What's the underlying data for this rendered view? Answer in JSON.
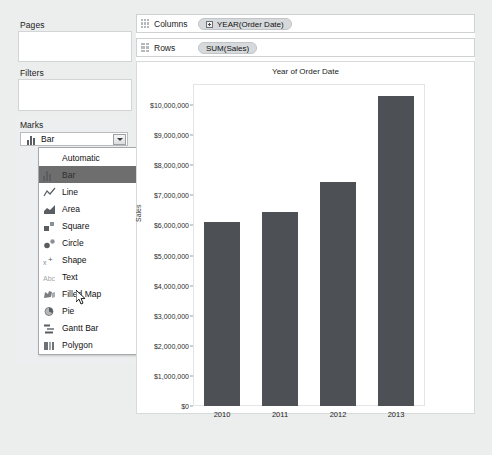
{
  "app": {
    "shelves": {
      "pages_label": "Pages",
      "filters_label": "Filters",
      "marks_label": "Marks"
    },
    "columns_shelf": {
      "name": "Columns",
      "pill": "YEAR(Order Date)",
      "pill_icon": "plus-expand-icon"
    },
    "rows_shelf": {
      "name": "Rows",
      "pill": "SUM(Sales)"
    }
  },
  "marks": {
    "selected": "Bar",
    "selected_icon": "bar-mark-icon",
    "dropdown_open": true,
    "highlighted_index": 1,
    "options": [
      {
        "label": "Automatic",
        "icon": "none"
      },
      {
        "label": "Bar",
        "icon": "bar-mark-icon"
      },
      {
        "label": "Line",
        "icon": "line-mark-icon"
      },
      {
        "label": "Area",
        "icon": "area-mark-icon"
      },
      {
        "label": "Square",
        "icon": "square-mark-icon"
      },
      {
        "label": "Circle",
        "icon": "circle-mark-icon"
      },
      {
        "label": "Shape",
        "icon": "shape-mark-icon"
      },
      {
        "label": "Text",
        "icon": "text-mark-icon"
      },
      {
        "label": "Filled Map",
        "icon": "filled-map-mark-icon"
      },
      {
        "label": "Pie",
        "icon": "pie-mark-icon"
      },
      {
        "label": "Gantt Bar",
        "icon": "gantt-bar-mark-icon"
      },
      {
        "label": "Polygon",
        "icon": "polygon-mark-icon"
      }
    ]
  },
  "chart_data": {
    "type": "bar",
    "title": "Year of Order Date",
    "xlabel": "",
    "ylabel": "Sales",
    "categories": [
      "2010",
      "2011",
      "2012",
      "2013"
    ],
    "values": [
      6100000,
      6450000,
      7450000,
      10300000
    ],
    "ylim": [
      0,
      10700000
    ],
    "yticks": [
      0,
      1000000,
      2000000,
      3000000,
      4000000,
      5000000,
      6000000,
      7000000,
      8000000,
      9000000,
      10000000
    ],
    "ytick_labels": [
      "$0",
      "$1,000,000",
      "$2,000,000",
      "$3,000,000",
      "$4,000,000",
      "$5,000,000",
      "$6,000,000",
      "$7,000,000",
      "$8,000,000",
      "$9,000,000",
      "$10,000,000"
    ],
    "grid": false,
    "legend": "none",
    "bar_color": "#4d5054"
  },
  "colors": {
    "panel": "#eceeef",
    "bar": "#4d5054",
    "pill": "#d7dadd",
    "highlight": "#6e6e6e"
  }
}
